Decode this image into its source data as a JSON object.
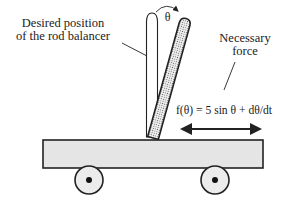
{
  "diagram": {
    "labels": {
      "desired_line1": "Desired position",
      "desired_line2": "of the rod balancer",
      "theta": "θ",
      "necessary_line1": "Necessary",
      "necessary_line2": "force",
      "formula": "f(θ) = 5 sin θ + dθ/dt"
    },
    "elements": {
      "vertical_rod": "desired rod position (upright)",
      "tilted_rod": "actual rod position (tilted, dotted fill)",
      "cart": "cart platform",
      "wheels": 2,
      "force_arrow": "double-headed horizontal arrow"
    },
    "colors": {
      "stroke": "#222222",
      "cart_fill": "#e6e6e6",
      "wheel_fill": "#ececec",
      "dots": "#555555"
    }
  }
}
